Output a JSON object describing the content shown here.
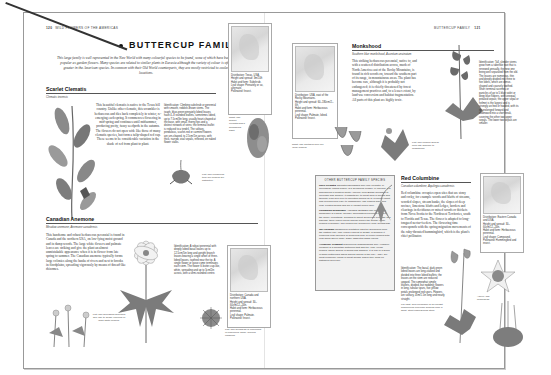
{
  "left_page": {
    "folio_number": "120",
    "folio_label": "WILD FLOWERS OF THE AMERICAS",
    "title": "BUTTERCUP FAMILY",
    "intro": "This large family is well represented in the New World with many colourful species to be found, some of which have become popular as garden flowers. Many species are related to similar plants in Eurasia although the variety of colour is often greater in the American species. In common with their Old World counterparts, they are mostly restricted to cooler locations.",
    "species": [
      {
        "name": "Scarlet Clematis",
        "latin": "Clematis texensis",
        "body": "This beautiful clematis is native to the Texas hill country. Unlike other clematis, this scrambler is herbaceous and dies back completely in winter, re-emerging each spring. It commences flowering in mid-spring and continues until midsummer, producing pretty, fuzzy seedpods in the autumn. The flowers do not open wide like those of many clematis species, but form a tulip-shaped red cup. These seems to be considerable variation in the shade of red from plant to plant.",
        "identification": "Identification: Climbing subshrub or perennial with smooth, reddish-brown stems. The tough, blue-green pinnately lobed leaves have 4–8 rounded leaflets, sometimes lobed, up to 7.5cm/3in long, usually heart-shaped at the base, with small, thorny tips and a distinct network of veins; the terminal leaflet is reduced to a tendril. The solitary, pendulous, scarlet-red or carmine flowers are urn-shaped, to 2.5cm/1in across, with thick, narrow, oval sepals, reflexed, on naked flower stalks.",
        "caption_left": "Left: The pendulous, tulip-like flowers are distinctive.",
        "caption_right": "Right: The scarlet clematis has a scrambling habit.",
        "facts": {
          "distribution": "Distribution: Texas, USA.",
          "height": "Height and spread: 3m/10ft",
          "habit": "Habit and form: Subshrub.",
          "leaf": "Leaf shape: Pinnately or so, alternate.",
          "pollinated": "Pollinated: Insect."
        }
      },
      {
        "name": "Canadian Anemone",
        "latin": "Meadow anemone, Anemone canadensis",
        "body": "This handsome and robust herbaceous perennial is found in Canada and the northern USA, on low-lying moist ground and in damp woods. The large white flowers and palmate leaves are striking and give the plant an almost unmistakable appearance when it is in flower from late spring to summer. The Canadian anemone typically forms large colonies along the banks of rivers and next to brooks in floodplains, spreading vigorously by means of thread-like rhizomes.",
        "caption_left": "Left: The spreading rhizomes give rise to dense colonies of large white flowers.",
        "identification": "Identification: A robust perennial with deeply lobed basal leaves up to 12.5cm/5in long and upright branch leaves bearing a single whorl of three-lobed leaves, toothed near the tip. A single flower or loose cyme terminates each stem. The flower is butter-cup-like, white, spreading and up to 5cm/2in across, with a semi-rounded centre.",
        "caption_right": "Left: The seedhead is composed of numerous, small, hooked capsules.",
        "facts": {
          "distribution": "Distribution: Canada and northern USA.",
          "height": "Height and spread: 30–60cm/12–24in.",
          "habit": "Habit and form: Herbaceous perennial.",
          "leaf": "Leaf shape: Palmate.",
          "pollinated": "Pollinated: Insect."
        }
      }
    ]
  },
  "right_page": {
    "folio_label": "BUTTERCUP FAMILY",
    "folio_number": "121",
    "species": [
      {
        "name": "Monkshood",
        "latin": "Southern blue monkshood, Aconitum uncinatum",
        "body": "This striking herbaceous perennial, native to, and with a scattered distribution across, much of North America east of the Rocky Mountains, is found in rich woods on, toward the southern part of its range, in mountainous areas. The plant has become rare, although it is probably not endangered; it is chiefly threatened by forest management practices and, to a lesser extent, by land-use conversion and habitat fragmentation. All parts of this plant are highly toxic.",
        "caption_left": "Right: The southern blue flor (wild) flowers.",
        "caption_right": "Left: The flowers appear from late summer to midautumn.",
        "identification": "Identification: Tall, slender stems grow from a tuberlike root that is renewed annually, the new one being well separated from the old. The leaves are numerous, thin and deeply divided into three to five lobes, which are dense-shaped and coarsely toothed. Short terminal racemes or panicles of up to 5 blue violet or deep blue flowers, with unequal petaloid sepals; the upper sepal or helmet is the largest and is strongly arched or hooded, with its tip prolonged forward and downward into a short beak, covering the other two upper sepals. The lower two sepals are smaller.",
        "facts": {
          "distribution": "Distribution: USA, east of the Rocky Mountains.",
          "height": "Height and spread: 60–180cm/2–6ft.",
          "habit": "Habit and form: Herbaceous perennial.",
          "leaf": "Leaf shape: Palmate, lobed.",
          "pollinated": "Pollinated: Insect."
        }
      },
      {
        "name": "Red Columbine",
        "latin": "Canadian columbine, Aquilegia canadensis",
        "body": "Red columbine occupies open sites that are stony and rocky, for example woods and bluffs of streams, wooded slopes, stream banks, the slopes of deep ravines, limestone bluffs and ledges, borders and clearings in deciduous or mixed woods or thickets from Nova Scotia to the Northwest Territories, south to Florida and Texas. The flower is adapted to long-tongued nectar-feeders. The flowering time corresponds with the spring migration movements of the ruby-throated hummingbird, which is the plant's chief pollinator.",
        "identification": "Identification: The basal, dark green lobed leaves are long-stalked and divided into three lobed leaflets; the leaves on the stem are reduced upward. The somewhat simple leaflets, divided, but nodding; flowers in long, tubular spurs, five yellow petals prolonged red spurs. Flowers are solitary, 4cm/1.5in long and nearly straight.",
        "caption_left": "Far right: Red columbine is an upright herbaceous perennial growing from a short, stout underground stem.",
        "caption_right": "Above: The flowerhead.",
        "facts": {
          "distribution": "Distribution: Eastern Canada and USA.",
          "height": "Height and spread: 30–60cm/12–24in.",
          "habit": "Habit and form: Herbaceous perennial.",
          "leaf": "Leaf shape: Compound.",
          "pollinated": "Pollinated: Hummingbird and insect."
        }
      }
    ],
    "other_species": {
      "title": "OTHER BUTTERCUP FAMILY SPECIES",
      "items": [
        {
          "name": "Rock Clematis",
          "latin": "Clematis columbiana",
          "text": "The rock clematis, or Columbian virgin's bower, is a deciduous climber, or 3m/10ft. It is widespread in western North America, from British Columbia to Colorado and Oregon. It inhabits dry to moist soils in woods and thickets, from sea-level to mountain slopes up to 3,000m/9,800ft, and is found from early to midsummer. The flowers have four long, pointed sepals and are a vibrant purple-blue."
        },
        {
          "name": "Columbian Windflower",
          "latin": "Anemone deltoidea",
          "text": "The Columbian windflower is a small, slender, rhizomatous perennial found in the Rocky Mountains. Growing to about 30cm/12in in height, this hairless, three-lobed leaves appear before the solitary white flowers in summer. The flowers are followed by fluffy seedheads."
        },
        {
          "name": "Tall Larkspur",
          "latin": "Delphinium exaltatum",
          "text": "This tall delphinium from the eastern USA may reach 1.8m/6ft in height. In summer it produces long racemes of numerous blue or purple flowers with long spurs above large, highly dissected basal leaves."
        },
        {
          "name": "Allegheny Crowfoot",
          "latin": "Ranunculus allegheniensis",
          "text": "The Allegheny crowfoot is a mountain buttercup that has tiny, pale yellow flowers, which appear in spring and summer. It is one of a group of small buttercups which appear similar in the USA. They are most commonly found in moist woods, where they grow on disturbed open soil."
        }
      ]
    }
  }
}
